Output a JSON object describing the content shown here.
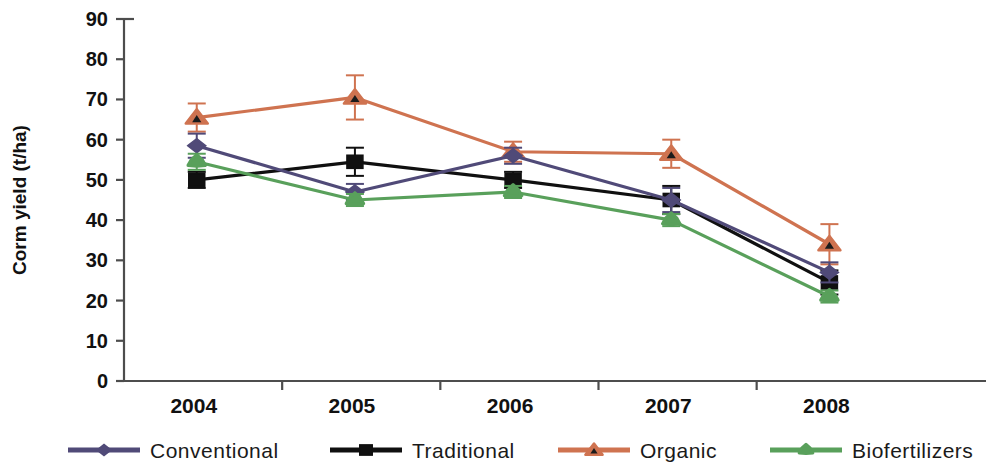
{
  "chart_data": {
    "type": "line",
    "title": "",
    "subtitle": "",
    "xlabel": "",
    "ylabel": "Corm yield (t/ha)",
    "categories": [
      "2004",
      "2005",
      "2006",
      "2007",
      "2008"
    ],
    "x": [
      2004,
      2005,
      2006,
      2007,
      2008
    ],
    "ylim": [
      0,
      90
    ],
    "yticks": [
      0,
      10,
      20,
      30,
      40,
      50,
      60,
      70,
      80,
      90
    ],
    "ytick_labels": [
      "0",
      "10",
      "20",
      "30",
      "40",
      "50",
      "60",
      "70",
      "80",
      "90"
    ],
    "grid": false,
    "legend_position": "bottom",
    "error_bars": true,
    "series": [
      {
        "name": "Conventional",
        "color": "#504a78",
        "marker": "diamond",
        "values": [
          58.5,
          47.0,
          56.0,
          45.0,
          27.0
        ],
        "errors": [
          3.0,
          2.0,
          2.0,
          3.0,
          2.5
        ]
      },
      {
        "name": "Traditional",
        "color": "#101010",
        "marker": "square",
        "values": [
          50.0,
          54.5,
          50.0,
          45.0,
          24.5
        ],
        "errors": [
          2.0,
          3.5,
          2.0,
          3.5,
          3.0
        ]
      },
      {
        "name": "Organic",
        "color": "#cf7350",
        "marker": "triangle",
        "values": [
          65.5,
          70.5,
          57.0,
          56.5,
          34.0
        ],
        "errors": [
          3.5,
          5.5,
          2.5,
          3.5,
          5.0
        ]
      },
      {
        "name": "Biofertilizers",
        "color": "#59a05b",
        "marker": "star",
        "values": [
          54.5,
          45.0,
          47.0,
          40.0,
          21.0
        ],
        "errors": [
          2.0,
          1.5,
          1.5,
          1.5,
          1.5
        ]
      }
    ]
  },
  "legend": {
    "items": [
      {
        "label": "Conventional"
      },
      {
        "label": "Traditional"
      },
      {
        "label": "Organic"
      },
      {
        "label": "Biofertilizers"
      }
    ]
  }
}
